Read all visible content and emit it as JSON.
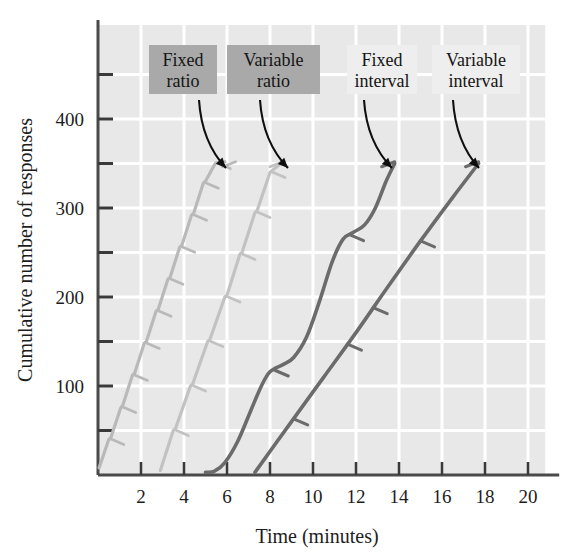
{
  "chart_data": {
    "type": "line",
    "title": "",
    "xlabel": "Time (minutes)",
    "ylabel": "Cumulative number of responses",
    "xlim": [
      0,
      20.8
    ],
    "ylim": [
      0,
      500
    ],
    "xticks": [
      2,
      4,
      6,
      8,
      10,
      12,
      14,
      16,
      18,
      20
    ],
    "xtick_labels": [
      "2",
      "4",
      "6",
      "8",
      "10",
      "12",
      "14",
      "16",
      "18",
      "20"
    ],
    "yticks": [
      100,
      200,
      300,
      400
    ],
    "ytick_labels": [
      "100",
      "200",
      "300",
      "400"
    ],
    "yminor_ticks": [
      50,
      150,
      250,
      350,
      450
    ],
    "grid": true,
    "grid_color": "#ffffff",
    "plot_bg": "#e8e8e8",
    "legend": "annotations",
    "series": [
      {
        "name": "Fixed ratio",
        "color": "#b9b9b9",
        "style": "steep-stepped",
        "description": "Steep steady line with brief post-reinforcement pauses",
        "points": [
          [
            0.05,
            8
          ],
          [
            0.5,
            40
          ],
          [
            0.6,
            42
          ],
          [
            1.05,
            75
          ],
          [
            1.15,
            78
          ],
          [
            1.6,
            112
          ],
          [
            1.7,
            114
          ],
          [
            2.15,
            148
          ],
          [
            2.25,
            150
          ],
          [
            2.7,
            184
          ],
          [
            2.8,
            186
          ],
          [
            3.25,
            220
          ],
          [
            3.35,
            222
          ],
          [
            3.8,
            256
          ],
          [
            3.9,
            258
          ],
          [
            4.35,
            292
          ],
          [
            4.45,
            294
          ],
          [
            4.9,
            328
          ],
          [
            5.0,
            330
          ],
          [
            5.45,
            350
          ],
          [
            5.9,
            352
          ]
        ],
        "hatch_marks": [
          [
            0.55,
            41
          ],
          [
            1.1,
            77
          ],
          [
            1.65,
            113
          ],
          [
            2.2,
            149
          ],
          [
            2.75,
            185
          ],
          [
            3.3,
            221
          ],
          [
            3.85,
            257
          ],
          [
            4.4,
            293
          ],
          [
            4.95,
            329
          ],
          [
            5.5,
            351
          ]
        ],
        "end_point": [
          6.4,
          352
        ]
      },
      {
        "name": "Variable ratio",
        "color": "#c2c2c2",
        "style": "steep-steady",
        "description": "Steep steady line with almost no pauses",
        "points": [
          [
            2.9,
            5
          ],
          [
            3.5,
            50
          ],
          [
            3.6,
            52
          ],
          [
            4.3,
            100
          ],
          [
            4.4,
            102
          ],
          [
            5.1,
            150
          ],
          [
            5.2,
            152
          ],
          [
            5.9,
            200
          ],
          [
            6.0,
            202
          ],
          [
            6.6,
            248
          ],
          [
            6.7,
            250
          ],
          [
            7.3,
            295
          ],
          [
            7.4,
            297
          ],
          [
            8.0,
            340
          ],
          [
            8.1,
            342
          ],
          [
            8.6,
            352
          ]
        ],
        "hatch_marks": [
          [
            3.55,
            51
          ],
          [
            4.35,
            101
          ],
          [
            5.15,
            151
          ],
          [
            5.95,
            201
          ],
          [
            6.65,
            249
          ],
          [
            7.35,
            296
          ],
          [
            8.05,
            341
          ]
        ],
        "end_point": [
          8.6,
          352
        ]
      },
      {
        "name": "Fixed interval",
        "color": "#6b6b6b",
        "style": "scalloped",
        "description": "Scalloped pattern — pause after reinforcement then accelerating responding",
        "points": [
          [
            5.0,
            3
          ],
          [
            5.4,
            4
          ],
          [
            5.9,
            14
          ],
          [
            6.5,
            38
          ],
          [
            7.1,
            72
          ],
          [
            7.6,
            100
          ],
          [
            8.0,
            116
          ],
          [
            8.6,
            124
          ],
          [
            9.1,
            132
          ],
          [
            9.7,
            155
          ],
          [
            10.3,
            195
          ],
          [
            10.9,
            240
          ],
          [
            11.4,
            265
          ],
          [
            11.9,
            273
          ],
          [
            12.4,
            281
          ],
          [
            12.9,
            300
          ],
          [
            13.4,
            330
          ],
          [
            13.8,
            350
          ]
        ],
        "hatch_marks": [
          [
            8.2,
            118
          ],
          [
            11.7,
            270
          ]
        ],
        "end_point": [
          13.8,
          352
        ]
      },
      {
        "name": "Variable interval",
        "color": "#6b6b6b",
        "style": "steady-moderate",
        "description": "Steady moderate slope, nearly straight line",
        "points": [
          [
            7.3,
            3
          ],
          [
            9.0,
            60
          ],
          [
            10.5,
            110
          ],
          [
            12.0,
            160
          ],
          [
            13.5,
            212
          ],
          [
            15.0,
            263
          ],
          [
            16.5,
            312
          ],
          [
            17.7,
            350
          ]
        ],
        "hatch_marks": [
          [
            9.1,
            63
          ],
          [
            11.6,
            147
          ],
          [
            12.8,
            188
          ],
          [
            15.0,
            263
          ]
        ],
        "end_point": [
          17.7,
          352
        ]
      }
    ],
    "annotations": [
      {
        "label_line1": "Fixed",
        "label_line2": "ratio",
        "box_fill": "#a9a9a9",
        "box_x": 149,
        "box_y": 45,
        "box_w": 68,
        "box_h": 49,
        "arrow_from": [
          199,
          100
        ],
        "arrow_to": [
          226,
          168
        ]
      },
      {
        "label_line1": "Variable",
        "label_line2": "ratio",
        "box_fill": "#a9a9a9",
        "box_x": 227,
        "box_y": 45,
        "box_w": 93,
        "box_h": 49,
        "arrow_from": [
          260,
          100
        ],
        "arrow_to": [
          288,
          168
        ]
      },
      {
        "label_line1": "Fixed",
        "label_line2": "interval",
        "box_fill": "#eeeeee",
        "box_x": 347,
        "box_y": 45,
        "box_w": 70,
        "box_h": 49,
        "arrow_from": [
          364,
          100
        ],
        "arrow_to": [
          392,
          168
        ]
      },
      {
        "label_line1": "Variable",
        "label_line2": "interval",
        "box_fill": "#eeeeee",
        "box_x": 432,
        "box_y": 45,
        "box_w": 88,
        "box_h": 49,
        "arrow_from": [
          453,
          100
        ],
        "arrow_to": [
          479,
          168
        ]
      }
    ]
  }
}
